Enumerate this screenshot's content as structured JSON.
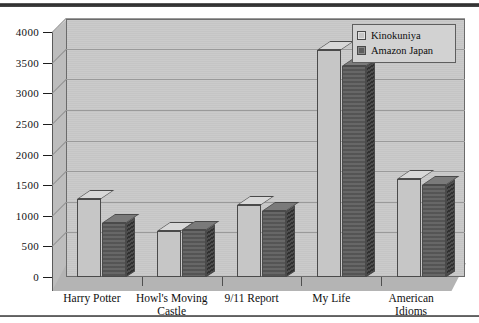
{
  "chart_data": {
    "type": "bar",
    "title": "",
    "subtitle": "",
    "xlabel": "",
    "ylabel": "",
    "ylim": [
      0,
      4000
    ],
    "ytick_values": [
      0,
      500,
      1000,
      1500,
      2000,
      2500,
      3000,
      3500,
      4000
    ],
    "ytick_labels": [
      "0",
      "500",
      "1000",
      "1500",
      "2000",
      "2500",
      "3000",
      "3500",
      "4000"
    ],
    "grid": true,
    "legend_position": "top-right",
    "three_d": true,
    "categories": [
      "Harry Potter",
      "Howl's Moving\nCastle",
      "9/11 Report",
      "My Life",
      "American\nIdioms"
    ],
    "series": [
      {
        "name": "Kinokuniya",
        "color": "#c6c6c6",
        "values": [
          1280,
          750,
          1180,
          3700,
          1600
        ]
      },
      {
        "name": "Amazon Japan",
        "color": "#5e5e5e",
        "values": [
          880,
          760,
          1080,
          3450,
          1500
        ]
      }
    ]
  },
  "legend": {
    "items": [
      {
        "label": "Kinokuniya",
        "swatch": "light-gray-swatch"
      },
      {
        "label": "Amazon Japan",
        "swatch": "dark-gray-swatch"
      }
    ]
  },
  "colors": {
    "plot_background": "#c9c9c9",
    "floor": "#b4b4b4",
    "side_wall": "#bdbdbd",
    "gridline": "#9a9a9a",
    "axis": "#5a5a5a",
    "series_light": "#c6c6c6",
    "series_dark": "#5e5e5e"
  }
}
